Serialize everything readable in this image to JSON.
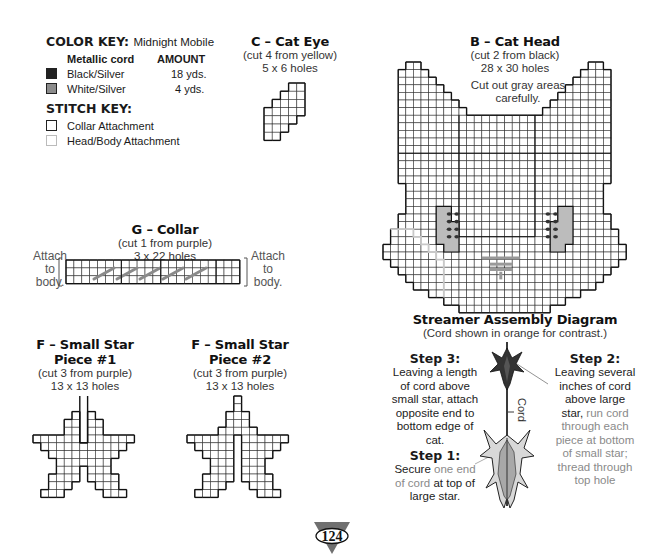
{
  "color_key": {
    "title": "COLOR KEY:",
    "project_name": "Midnight Mobile",
    "col_material": "Metallic cord",
    "col_amount": "AMOUNT",
    "items": [
      {
        "label": "Black/Silver",
        "amount": "18 yds.",
        "color": "#222222"
      },
      {
        "label": "White/Silver",
        "amount": "4 yds.",
        "color": "#8c8c8c"
      }
    ]
  },
  "stitch_key": {
    "title": "STITCH KEY:",
    "items": [
      {
        "label": "Collar Attachment",
        "color": "#222222"
      },
      {
        "label": "Head/Body Attachment",
        "color": "#bdbdbd"
      }
    ]
  },
  "pieces": {
    "cat_eye": {
      "title": "C – Cat Eye",
      "cut": "(cut 4 from yellow)",
      "size": "5 x 6 holes"
    },
    "cat_head": {
      "title": "B – Cat Head",
      "cut": "(cut 2 from black)",
      "size": "28 x 30 holes",
      "note_line1": "Cut out gray areas",
      "note_line2": "carefully."
    },
    "collar": {
      "title": "G – Collar",
      "cut": "(cut 1 from purple)",
      "size": "3 x 22 holes",
      "left_label": [
        "Attach",
        "to",
        "body."
      ],
      "right_label": [
        "Attach",
        "to",
        "body."
      ]
    },
    "star1": {
      "title_line1": "F – Small Star",
      "title_line2": "Piece #1",
      "cut": "(cut 3 from purple)",
      "size": "13 x 13 holes"
    },
    "star2": {
      "title_line1": "F – Small Star",
      "title_line2": "Piece #2",
      "cut": "(cut 3 from purple)",
      "size": "13 x 13 holes"
    }
  },
  "streamer": {
    "title": "Streamer Assembly Diagram",
    "subtitle": "(Cord shown in orange for contrast.)",
    "cord_label": "Cord",
    "step3": {
      "heading": "Step 3:",
      "lines": [
        "Leaving a length",
        "of cord above",
        "small star, attach",
        "opposite end to",
        "bottom edge of",
        "cat."
      ]
    },
    "step2": {
      "heading": "Step 2:",
      "lines_dark": [
        "Leaving several",
        "inches of cord",
        "above large",
        "star,"
      ],
      "lines_gray_inline": " run cord",
      "lines_gray": [
        "through each",
        "piece at bottom",
        "of small star;",
        "thread through",
        "top hole"
      ]
    },
    "step1": {
      "heading": "Step 1:",
      "l1_dark": "Secure",
      "l1_gray": " one end",
      "l2_gray": "of cord",
      "l2_dark": " at top of",
      "l3_dark": "large star."
    }
  },
  "page_number": "124",
  "colors": {
    "grid_line": "#222222",
    "gray_cutout": "#bcbcbc",
    "collar_stitch": "#8a8a8a",
    "head_body_line": "#c8c8c8"
  }
}
